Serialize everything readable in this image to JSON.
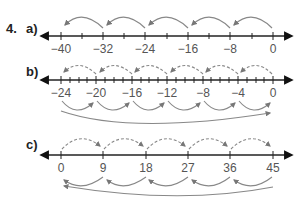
{
  "question_number": "4.",
  "parts": [
    {
      "label": "a)",
      "ticks": [
        "−40",
        "−32",
        "−24",
        "−16",
        "−8",
        "0"
      ],
      "minor_ticks_per_step": 1,
      "jumps": "solid arcs above, right to left, step −8",
      "arrow_color": "#888888"
    },
    {
      "label": "b)",
      "ticks": [
        "−24",
        "−20",
        "−16",
        "−12",
        "−8",
        "−4",
        "0"
      ],
      "minor_ticks_per_step": 3,
      "jumps": "dashed arcs above right to left (step −4), solid arcs below left to right (step +4), long solid arc below from −24 to 0",
      "arrow_color": "#888888"
    },
    {
      "label": "c)",
      "ticks": [
        "0",
        "9",
        "18",
        "27",
        "36",
        "45"
      ],
      "minor_ticks_per_step": 0,
      "jumps": "dashed arcs above left to right (step +9), solid arcs below right to left (step −9), long solid arc below from 45 to 0",
      "arrow_color": "#888888"
    }
  ]
}
